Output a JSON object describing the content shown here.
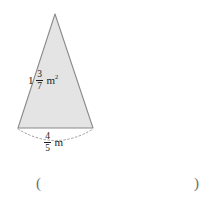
{
  "figure": {
    "shape_name": "triangle",
    "fill_color": "#e4e4e4",
    "stroke_color": "#8a8a8a",
    "dotted_arc_color": "#9a9a9a",
    "apex": {
      "x": 55,
      "y": 14
    },
    "base_left": {
      "x": 18,
      "y": 128
    },
    "base_right": {
      "x": 93,
      "y": 128
    },
    "area_label": {
      "whole": "1",
      "numerator": "3",
      "denominator": "7",
      "unit": "m",
      "unit_exponent": "2",
      "plain_text": "1 3/7 m²"
    },
    "base_label": {
      "numerator": "4",
      "denominator": "5",
      "unit": "m",
      "plain_text": "4/5 m"
    }
  },
  "answer": {
    "left_paren": "(",
    "right_paren": ")",
    "value": "",
    "placeholder": ""
  }
}
